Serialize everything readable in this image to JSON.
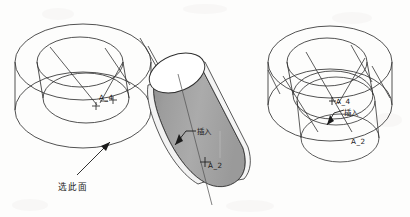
{
  "figure": {
    "title": "",
    "background_color": "#fdfdfc",
    "line_color": "#333333",
    "shade_color": "#a9a9a9",
    "shade_color_dark": "#8f8f8f",
    "text_color": "#1b1b1b"
  },
  "left_view": {
    "name": "left-assembly-view",
    "labels": {
      "axis_marker": "A_4",
      "insert": "插入",
      "insert_axis_marker": "A_2",
      "select_face": "选此面"
    }
  },
  "right_view": {
    "name": "right-assembly-view",
    "labels": {
      "axis_marker_top": "A_4",
      "insert": "插入",
      "axis_marker_bottom": "A_2"
    }
  },
  "watermark": {
    "text": ""
  }
}
